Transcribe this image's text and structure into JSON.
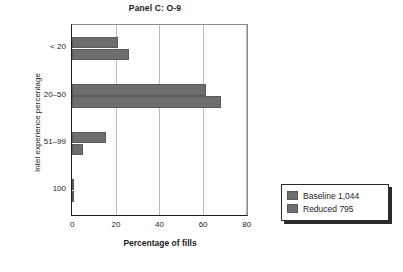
{
  "chart_data": {
    "type": "bar",
    "orientation": "horizontal",
    "title": "Panel C: O-9",
    "xlabel": "Percentage of fills",
    "ylabel": "Intel experience percentage",
    "categories": [
      "< 20",
      "20–50",
      "51–99",
      "100"
    ],
    "xticks": [
      0,
      20,
      40,
      60,
      80
    ],
    "xlim": [
      0,
      80
    ],
    "grid": "vertical",
    "legend_position": "right-outside",
    "series": [
      {
        "name": "Baseline 1,044",
        "color": "#6e6e6e",
        "values": [
          21,
          61.5,
          15.5,
          0.8
        ]
      },
      {
        "name": "Reduced 795",
        "color": "#6e6e6e",
        "values": [
          26,
          68.5,
          5,
          0.6
        ]
      }
    ]
  },
  "legend": {
    "entries": [
      {
        "label": "Baseline 1,044"
      },
      {
        "label": "Reduced 795"
      }
    ]
  },
  "axes": {
    "y_tick_labels": [
      "< 20",
      "20–50",
      "51–99",
      "100"
    ],
    "x_tick_labels": [
      "0",
      "20",
      "40",
      "60",
      "80"
    ]
  }
}
